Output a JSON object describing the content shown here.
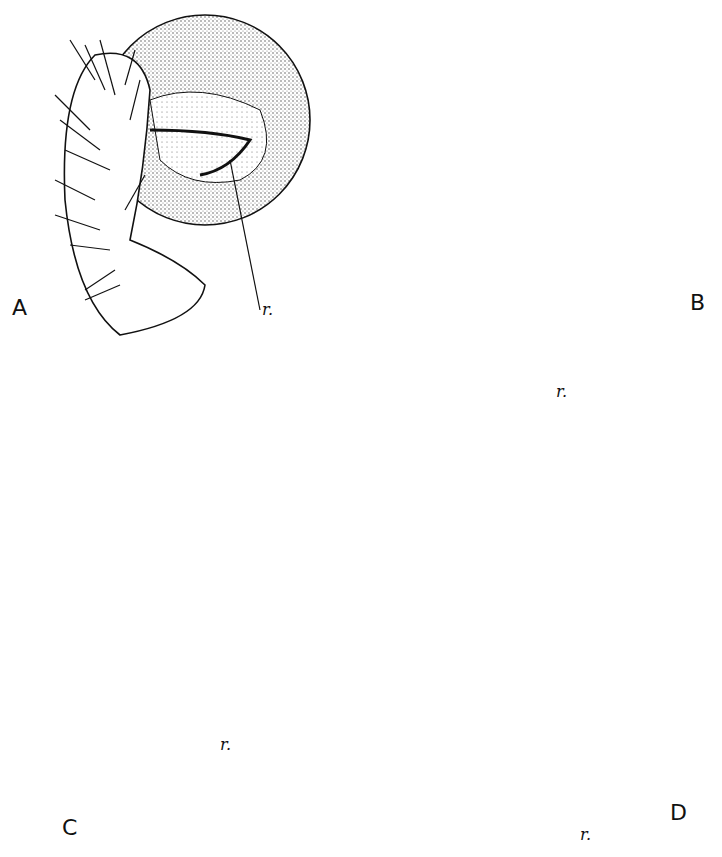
{
  "figure": {
    "panels": [
      {
        "id": "A",
        "label": "A",
        "annotation": "r."
      },
      {
        "id": "B",
        "label": "B",
        "annotation": "r."
      },
      {
        "id": "C",
        "label": "C",
        "annotation": "r."
      },
      {
        "id": "D",
        "label": "D",
        "annotation": "r."
      }
    ],
    "colors": {
      "ink": "#111111",
      "background": "#ffffff",
      "stipple": "#777777"
    }
  }
}
